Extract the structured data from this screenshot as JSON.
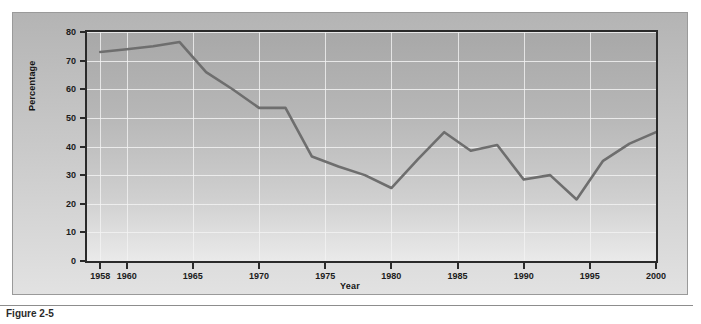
{
  "figure": {
    "caption": "Figure 2-5"
  },
  "chart_data": {
    "type": "line",
    "title": "",
    "xlabel": "Year",
    "ylabel": "Percentage",
    "xlim": [
      1957,
      2000
    ],
    "ylim": [
      0,
      80
    ],
    "ytick_values": [
      0,
      10,
      20,
      30,
      40,
      50,
      60,
      70,
      80
    ],
    "ytick_labels": [
      "0",
      "10",
      "20",
      "30",
      "40",
      "50",
      "60",
      "70",
      "80"
    ],
    "xtick_values": [
      1958,
      1960,
      1965,
      1970,
      1975,
      1980,
      1985,
      1990,
      1995,
      2000
    ],
    "xtick_labels": [
      "1958",
      "1960",
      "1965",
      "1970",
      "1975",
      "1980",
      "1985",
      "1990",
      "1995",
      "2000"
    ],
    "grid": true,
    "legend": null,
    "line_color": "#6e6e6e",
    "series": [
      {
        "name": "Percentage",
        "x": [
          1958,
          1960,
          1962,
          1964,
          1966,
          1968,
          1970,
          1972,
          1974,
          1976,
          1978,
          1980,
          1982,
          1984,
          1986,
          1988,
          1990,
          1992,
          1994,
          1996,
          1998,
          2000
        ],
        "values": [
          73,
          74,
          75,
          76.5,
          66,
          60,
          53.5,
          53.5,
          36.5,
          33,
          30,
          25.5,
          35.5,
          45,
          38.5,
          40.5,
          28.5,
          30,
          21.5,
          35,
          41,
          45
        ]
      }
    ]
  }
}
